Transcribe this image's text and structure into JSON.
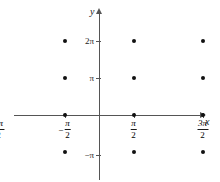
{
  "chart_data": {
    "type": "scatter",
    "title": "",
    "xlabel": "x",
    "ylabel": "y",
    "grid": false,
    "legend": null,
    "xlim": [
      -2.2,
      3.2
    ],
    "ylim": [
      -1.6,
      2.6
    ],
    "x_unit": "pi",
    "y_unit": "pi",
    "x_tick_values": [
      -1.5,
      -0.5,
      0.5,
      1.5,
      2.5
    ],
    "y_tick_values": [
      -1,
      1,
      2
    ],
    "x_tick_labels": [
      {
        "sign": "−",
        "numerator": "3π",
        "denominator": "2",
        "text": "-3π/2"
      },
      {
        "sign": "−",
        "numerator": "π",
        "denominator": "2",
        "text": "-π/2"
      },
      {
        "sign": "",
        "numerator": "π",
        "denominator": "2",
        "text": "π/2"
      },
      {
        "sign": "",
        "numerator": "3π",
        "denominator": "2",
        "text": "3π/2"
      },
      {
        "sign": "",
        "numerator": "5π",
        "denominator": "2",
        "text": "5π/2"
      }
    ],
    "y_tick_labels": [
      "2π",
      "π",
      "−π"
    ],
    "points": [
      {
        "x": -1.5,
        "y": 2
      },
      {
        "x": -0.5,
        "y": 2
      },
      {
        "x": 0.5,
        "y": 2
      },
      {
        "x": 1.5,
        "y": 2
      },
      {
        "x": 2.5,
        "y": 2
      },
      {
        "x": -1.5,
        "y": 1
      },
      {
        "x": -0.5,
        "y": 1
      },
      {
        "x": 0.5,
        "y": 1
      },
      {
        "x": 1.5,
        "y": 1
      },
      {
        "x": 2.5,
        "y": 1
      },
      {
        "x": -1.5,
        "y": 0
      },
      {
        "x": -0.5,
        "y": 0
      },
      {
        "x": 0.5,
        "y": 0
      },
      {
        "x": 1.5,
        "y": 0
      },
      {
        "x": 2.5,
        "y": 0
      },
      {
        "x": -1.5,
        "y": -1
      },
      {
        "x": -0.5,
        "y": -1
      },
      {
        "x": 0.5,
        "y": -1
      },
      {
        "x": 1.5,
        "y": -1
      },
      {
        "x": 2.5,
        "y": -1
      }
    ],
    "point_color": "#111111",
    "axis_color": "#555555",
    "background_color": "#ffffff"
  },
  "figure": {
    "x_axis_label": "x",
    "y_axis_label": "y",
    "y_label_2pi": "2π",
    "y_label_pi": "π",
    "y_label_neg_pi": "−π"
  }
}
